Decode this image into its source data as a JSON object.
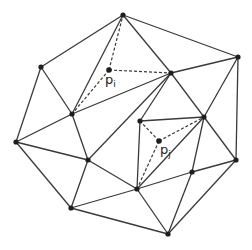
{
  "diagram": {
    "type": "triangulation",
    "vertices": {
      "A": [
        123,
        15
      ],
      "B": [
        41,
        67
      ],
      "C": [
        16,
        142
      ],
      "D": [
        72,
        114
      ],
      "E": [
        88,
        160
      ],
      "F": [
        71,
        208
      ],
      "G": [
        168,
        234
      ],
      "H": [
        236,
        160
      ],
      "I": [
        238,
        57
      ],
      "J": [
        171,
        73
      ],
      "K": [
        140,
        121
      ],
      "L": [
        204,
        117
      ],
      "M": [
        137,
        189
      ],
      "N": [
        192,
        172
      ]
    },
    "special_points": {
      "pi": {
        "pos": [
          109,
          70
        ],
        "label": "p",
        "subscript": "i"
      },
      "pj": {
        "pos": [
          159,
          141
        ],
        "label": "p",
        "subscript": "j"
      }
    },
    "edges": [
      [
        "A",
        "B"
      ],
      [
        "A",
        "I"
      ],
      [
        "A",
        "J"
      ],
      [
        "A",
        "D"
      ],
      [
        "B",
        "D"
      ],
      [
        "B",
        "C"
      ],
      [
        "C",
        "D"
      ],
      [
        "C",
        "E"
      ],
      [
        "C",
        "F"
      ],
      [
        "D",
        "J"
      ],
      [
        "D",
        "E"
      ],
      [
        "E",
        "J"
      ],
      [
        "E",
        "F"
      ],
      [
        "E",
        "M"
      ],
      [
        "F",
        "M"
      ],
      [
        "F",
        "G"
      ],
      [
        "M",
        "G"
      ],
      [
        "M",
        "N"
      ],
      [
        "N",
        "H"
      ],
      [
        "N",
        "G"
      ],
      [
        "G",
        "H"
      ],
      [
        "H",
        "I"
      ],
      [
        "I",
        "J"
      ],
      [
        "J",
        "L"
      ],
      [
        "I",
        "L"
      ],
      [
        "L",
        "H"
      ],
      [
        "L",
        "N"
      ],
      [
        "J",
        "K"
      ],
      [
        "K",
        "L"
      ],
      [
        "K",
        "M"
      ],
      [
        "L",
        "M"
      ]
    ],
    "dashed_edges": [
      [
        "pi",
        "A"
      ],
      [
        "pi",
        "D"
      ],
      [
        "pi",
        "J"
      ],
      [
        "pj",
        "K"
      ],
      [
        "pj",
        "L"
      ],
      [
        "pj",
        "M"
      ]
    ]
  }
}
